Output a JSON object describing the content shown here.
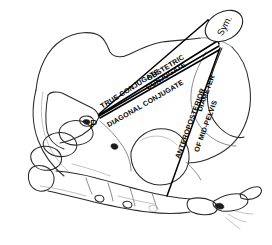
{
  "figure": {
    "background_color": "#ffffff",
    "ink_color": "#1c1c1c",
    "line_color": "#000000"
  },
  "landmarks": {
    "promontory": {
      "label": "P",
      "name": "sacral-promontory",
      "x": 99,
      "y": 117
    },
    "symphysis": {
      "label": "Sym.",
      "name": "symphysis-pubis",
      "x": 224,
      "y": 28
    }
  },
  "diameters": [
    {
      "id": "true-conjugate",
      "label_lines": [
        "TRUE CONJUGATE"
      ],
      "label": "TRUE CONJUGATE"
    },
    {
      "id": "obstetric-conjugate",
      "label_lines": [
        "OBSTETRIC",
        "CONJUGATE"
      ],
      "label": "OBSTETRIC CONJUGATE"
    },
    {
      "id": "diagonal-conjugate",
      "label_lines": [
        "DIAGONAL CONJUGATE"
      ],
      "label": "DIAGONAL CONJUGATE"
    },
    {
      "id": "anteroposterior-mid-pelvis",
      "label_lines": [
        "ANTEROPOSTERIOR",
        "DIAMETER",
        "OF  MID-PELVIS"
      ],
      "label": "ANTEROPOSTERIOR DIAMETER OF MID-PELVIS"
    }
  ],
  "labels": {
    "true_conjugate": "TRUE CONJUGATE",
    "obstetric_1": "OBSTETRIC",
    "obstetric_2": "CONJUGATE",
    "diagonal_conjugate": "DIAGONAL CONJUGATE",
    "ap_1": "ANTEROPOSTERIOR",
    "ap_2": "DIAMETER",
    "ap_3": "OF  MID-PELVIS",
    "promontory": "P",
    "symphysis": "Sym."
  }
}
